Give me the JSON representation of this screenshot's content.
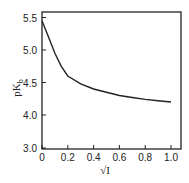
{
  "chart_data": {
    "type": "line",
    "title": "",
    "xlabel": "√I",
    "ylabel": "pK_b",
    "xlim": [
      0,
      1.07
    ],
    "ylim": [
      3.0,
      5.55
    ],
    "x_ticks": [
      "0",
      "0.2",
      "0.4",
      "0.6",
      "0.8",
      "1.0"
    ],
    "y_ticks": [
      "3.0",
      "4.0",
      "4.5",
      "5.0",
      "5.5"
    ],
    "y_axis_note": "broken scale: 3.0 directly below 4.0 with same spacing",
    "grid": false,
    "legend": null,
    "series": [
      {
        "name": "pK_b vs √I",
        "x": [
          0,
          0.05,
          0.1,
          0.15,
          0.2,
          0.3,
          0.4,
          0.5,
          0.6,
          0.7,
          0.8,
          0.9,
          1.0
        ],
        "y": [
          5.45,
          5.2,
          4.95,
          4.75,
          4.6,
          4.48,
          4.4,
          4.35,
          4.3,
          4.27,
          4.24,
          4.22,
          4.2
        ]
      }
    ]
  }
}
